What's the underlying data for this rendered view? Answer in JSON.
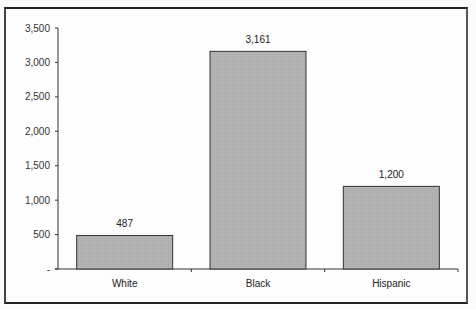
{
  "chart_data": {
    "type": "bar",
    "title": "",
    "xlabel": "",
    "ylabel": "",
    "categories": [
      "White",
      "Black",
      "Hispanic"
    ],
    "values": [
      487,
      3161,
      1200
    ],
    "data_labels": [
      "487",
      "3,161",
      "1,200"
    ],
    "ylim": [
      0,
      3500
    ],
    "yticks": [
      0,
      500,
      1000,
      1500,
      2000,
      2500,
      3000,
      3500
    ],
    "ytick_labels": [
      "-",
      "500",
      "1,000",
      "1,500",
      "2,000",
      "2,500",
      "3,000",
      "3,500"
    ],
    "grid": false,
    "legend": null,
    "bar_color": "#b4b4b4",
    "bar_edge_color": "#333333"
  }
}
